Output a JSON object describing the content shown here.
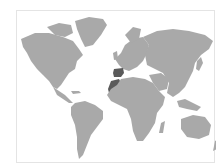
{
  "map": {
    "type": "world-choropleth",
    "colors": {
      "background": "#ffffff",
      "frame_border": "#e4e4e4",
      "land": "#a9a9a9",
      "highlight": "#5a5a5a"
    },
    "highlighted_regions": [
      "Spain",
      "Morocco"
    ]
  }
}
